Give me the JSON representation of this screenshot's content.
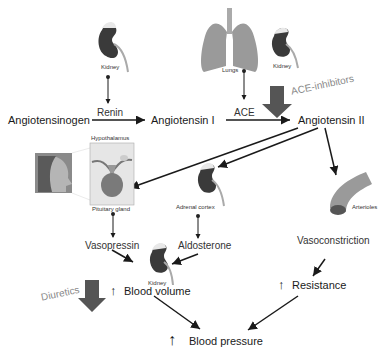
{
  "nodes": {
    "angiotensinogen": "Angiotensinogen",
    "angiotensin_1": "Angiotensin I",
    "angiotensin_2": "Angiotensin II",
    "vasopressin": "Vasopressin",
    "aldosterone": "Aldosterone",
    "vasoconstriction": "Vasoconstriction",
    "blood_volume": "Blood volume",
    "resistance": "Resistance",
    "blood_pressure": "Blood pressure"
  },
  "enzymes": {
    "renin": "Renin",
    "ace": "ACE"
  },
  "organs": {
    "kidney_top": "Kidney",
    "lungs": "Lungs",
    "kidney_right": "Kidney",
    "hypothalamus": "Hypothalamus",
    "pituitary": "Pituitary gland",
    "adrenal": "Adrenal cortex",
    "arterioles": "Arterioles",
    "kidney_bottom": "Kidney"
  },
  "drugs": {
    "ace_inhibitors": "ACE-inhibitors",
    "diuretics": "Diuretics"
  },
  "symbols": {
    "increase": "↑"
  },
  "colors": {
    "kidney": "#3a3a3a",
    "organ_gray": "#9a9a9a",
    "inhibitor_arrow": "#555555",
    "arrow": "#1a1a1a"
  }
}
